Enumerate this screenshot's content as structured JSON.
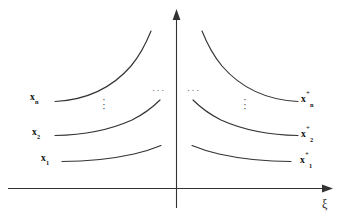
{
  "figure": {
    "stroke_color": "#333333",
    "text_color": "#111111",
    "background": "#ffffff"
  },
  "axes": {
    "horizontal": {
      "label": "ξ",
      "name": "xi-axis",
      "arrow": "right"
    },
    "vertical": {
      "label": "",
      "name": "vertical-axis",
      "arrow": "up"
    }
  },
  "left_labels": [
    {
      "base": "x",
      "sub": "1",
      "sup": ""
    },
    {
      "base": "x",
      "sub": "2",
      "sup": ""
    },
    {
      "base": "x",
      "sub": "n",
      "sup": ""
    }
  ],
  "right_labels": [
    {
      "base": "x",
      "sub": "1",
      "sup": "+"
    },
    {
      "base": "x",
      "sub": "2",
      "sup": "+"
    },
    {
      "base": "x",
      "sub": "n",
      "sup": "+"
    }
  ],
  "ellipses": {
    "vertical_left": "⋮",
    "vertical_right": "⋮",
    "horizontal_left": "···",
    "horizontal_right": "···",
    "dot": "·"
  }
}
